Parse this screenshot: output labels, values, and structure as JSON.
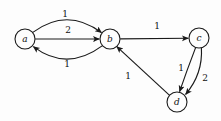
{
  "diagram": {
    "type": "directed-weighted-graph",
    "background_color": "#fdfdfd",
    "stroke_color": "#1a1a1a",
    "nodes": [
      {
        "id": "a",
        "label": "a",
        "cx": 25,
        "cy": 39,
        "r": 10
      },
      {
        "id": "b",
        "label": "b",
        "cx": 110,
        "cy": 39,
        "r": 10
      },
      {
        "id": "c",
        "label": "c",
        "cx": 199,
        "cy": 38,
        "r": 10
      },
      {
        "id": "d",
        "label": "d",
        "cx": 177,
        "cy": 102,
        "r": 10
      }
    ],
    "edges": [
      {
        "from": "a",
        "to": "b",
        "weight": "1",
        "shape": "curve-up",
        "label_x": 65,
        "label_y": 14
      },
      {
        "from": "a",
        "to": "b",
        "weight": "2",
        "shape": "straight",
        "label_x": 68,
        "label_y": 30
      },
      {
        "from": "b",
        "to": "a",
        "weight": "1",
        "shape": "curve-down",
        "label_x": 67,
        "label_y": 64
      },
      {
        "from": "b",
        "to": "c",
        "weight": "1",
        "shape": "straight",
        "label_x": 157,
        "label_y": 26
      },
      {
        "from": "c",
        "to": "d",
        "weight": "1",
        "shape": "curve-left",
        "label_x": 181,
        "label_y": 68
      },
      {
        "from": "c",
        "to": "d",
        "weight": "2",
        "shape": "curve-right",
        "label_x": 205,
        "label_y": 78
      },
      {
        "from": "d",
        "to": "b",
        "weight": "1",
        "shape": "straight",
        "label_x": 128,
        "label_y": 76
      }
    ]
  }
}
